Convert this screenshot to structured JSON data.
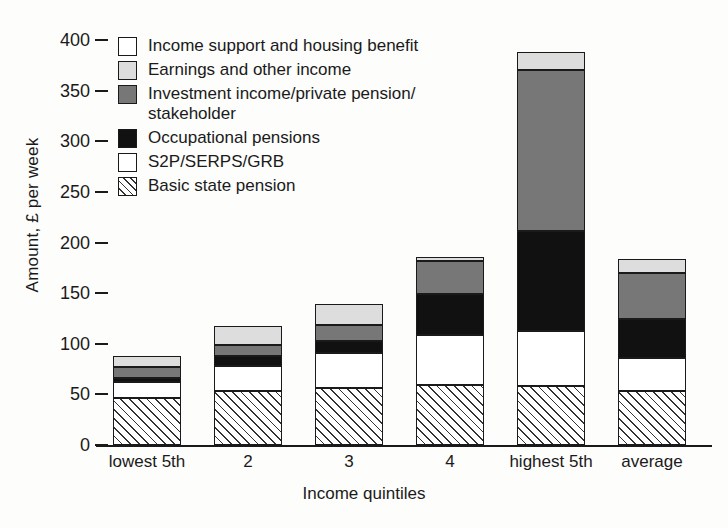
{
  "chart_data": {
    "type": "bar",
    "subtype": "stacked",
    "title": "",
    "xlabel": "Income quintiles",
    "ylabel": "Amount, £ per week",
    "categories": [
      "lowest 5th",
      "2",
      "3",
      "4",
      "highest 5th",
      "average"
    ],
    "ylim": [
      0,
      400
    ],
    "yticks": [
      0,
      50,
      100,
      150,
      200,
      250,
      300,
      350,
      400
    ],
    "ytick_labels": [
      "0",
      "50",
      "100",
      "150",
      "200",
      "250",
      "300",
      "350",
      "400"
    ],
    "grid": false,
    "legend_position": "top-left",
    "series": [
      {
        "name": "Basic state pension",
        "swatch": "s-hatch",
        "values": [
          46,
          53,
          56,
          59,
          58,
          53
        ]
      },
      {
        "name": "S2P/SERPS/GRB",
        "swatch": "s-white",
        "values": [
          16,
          25,
          35,
          50,
          55,
          33
        ]
      },
      {
        "name": "Occupational pensions",
        "swatch": "s-black",
        "values": [
          4,
          10,
          12,
          40,
          98,
          38
        ]
      },
      {
        "name": "Investment income/private pension/ stakeholder",
        "swatch": "s-dgrey",
        "values": [
          11,
          11,
          16,
          33,
          159,
          46
        ]
      },
      {
        "name": "Earnings and other income",
        "swatch": "s-lgrey",
        "values": [
          11,
          19,
          20,
          4,
          18,
          14
        ]
      },
      {
        "name": "Income support and housing benefit",
        "swatch": "s-white",
        "values": [
          0,
          0,
          0,
          0,
          0,
          0
        ]
      }
    ],
    "totals": [
      88,
      118,
      139,
      186,
      388,
      184
    ],
    "annotations": []
  },
  "legend": {
    "items": [
      {
        "label": "Income support and housing benefit",
        "swatch": "s-white"
      },
      {
        "label": "Earnings and other income",
        "swatch": "s-lgrey"
      },
      {
        "label": "Investment income/private pension/",
        "label2": "stakeholder",
        "swatch": "s-dgrey"
      },
      {
        "label": "Occupational pensions",
        "swatch": "s-black"
      },
      {
        "label": "S2P/SERPS/GRB",
        "swatch": "s-white"
      },
      {
        "label": "Basic state pension",
        "swatch": "s-hatch"
      }
    ]
  },
  "axes": {
    "y_title": "Amount, £ per week",
    "x_title": "Income quintiles",
    "y_labels": [
      "400",
      "350",
      "300",
      "250",
      "200",
      "150",
      "100",
      "50",
      "0"
    ],
    "x_labels": [
      "lowest 5th",
      "2",
      "3",
      "4",
      "highest 5th",
      "average"
    ]
  },
  "colors": {
    "axis": "#1a1a1a",
    "basic_state_pension": "#ffffff",
    "s2p_serps_grb": "#ffffff",
    "occupational_pensions": "#111111",
    "investment_income": "#777777",
    "earnings_other_income": "#dddddd",
    "income_support_housing": "#ffffff"
  }
}
